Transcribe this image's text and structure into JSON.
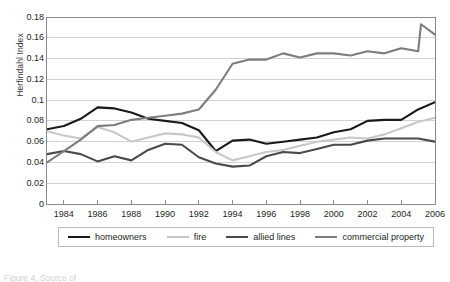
{
  "chart_data": {
    "type": "line",
    "title": "",
    "xlabel": "",
    "ylabel": "Herfindahl Index",
    "ylim": [
      0,
      0.18
    ],
    "ytick_step": 0.02,
    "yticks": [
      "0.18",
      "0.16",
      "0.14",
      "0.12",
      "0.1",
      "0.08",
      "0.06",
      "0.04",
      "0.02",
      "0"
    ],
    "grid": "horizontal",
    "legend_position": "bottom",
    "x": [
      1983,
      1984,
      1985,
      1986,
      1987,
      1988,
      1989,
      1990,
      1991,
      1992,
      1993,
      1994,
      1995,
      1996,
      1997,
      1998,
      1999,
      2000,
      2001,
      2002,
      2003,
      2004,
      2005,
      2006
    ],
    "xtick_labels": [
      "1984",
      "1986",
      "1988",
      "1990",
      "1992",
      "1994",
      "1996",
      "1998",
      "2000",
      "2002",
      "2004",
      "2006"
    ],
    "xtick_values": [
      1984,
      1986,
      1988,
      1990,
      1992,
      1994,
      1996,
      1998,
      2000,
      2002,
      2004,
      2006
    ],
    "series": [
      {
        "name": "homeowners",
        "color": "#1a1a1a",
        "width": 2.1,
        "values": [
          0.072,
          0.075,
          0.082,
          0.093,
          0.092,
          0.088,
          0.082,
          0.08,
          0.078,
          0.071,
          0.051,
          0.061,
          0.062,
          0.058,
          0.06,
          0.062,
          0.064,
          0.069,
          0.072,
          0.08,
          0.081,
          0.081,
          0.091,
          0.098
        ]
      },
      {
        "name": "fire",
        "color": "#c8c8c8",
        "width": 2.1,
        "values": [
          0.07,
          0.066,
          0.063,
          0.074,
          0.069,
          0.06,
          0.064,
          0.068,
          0.067,
          0.064,
          0.05,
          0.042,
          0.046,
          0.05,
          0.052,
          0.056,
          0.06,
          0.062,
          0.064,
          0.063,
          0.067,
          0.073,
          0.079,
          0.083
        ]
      },
      {
        "name": "allied lines",
        "color": "#4a4a4a",
        "width": 2.1,
        "values": [
          0.048,
          0.051,
          0.048,
          0.041,
          0.046,
          0.042,
          0.052,
          0.058,
          0.057,
          0.045,
          0.039,
          0.036,
          0.037,
          0.046,
          0.05,
          0.049,
          0.053,
          0.057,
          0.057,
          0.061,
          0.063,
          0.063,
          0.063,
          0.06
        ]
      },
      {
        "name": "commercial property",
        "color": "#7d7d7d",
        "width": 2.1,
        "values": [
          0.04,
          0.051,
          0.062,
          0.075,
          0.076,
          0.081,
          0.083,
          0.085,
          0.087,
          0.091,
          0.11,
          0.135,
          0.139,
          0.139,
          0.145,
          0.141,
          0.145,
          0.145,
          0.143,
          0.147,
          0.145,
          0.15,
          0.147,
          0.173
        ]
      }
    ],
    "series_endpoint_2006": {
      "commercial property": 0.163
    }
  },
  "legend": {
    "items": [
      {
        "label": "homeowners"
      },
      {
        "label": "fire"
      },
      {
        "label": "allied lines"
      },
      {
        "label": "commercial property"
      }
    ]
  },
  "caption": {
    "text": "Figure 4.  Source of"
  }
}
